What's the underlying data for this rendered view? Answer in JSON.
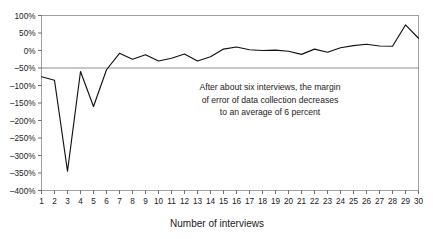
{
  "chart_data": {
    "type": "line",
    "title": "",
    "xlabel": "Number of interviews",
    "ylabel": "",
    "x": [
      1,
      2,
      3,
      4,
      5,
      6,
      7,
      8,
      9,
      10,
      11,
      12,
      13,
      14,
      15,
      16,
      17,
      18,
      19,
      20,
      21,
      22,
      23,
      24,
      25,
      26,
      27,
      28,
      29,
      30
    ],
    "values": [
      -75,
      -85,
      -345,
      -60,
      -160,
      -55,
      -8,
      -25,
      -12,
      -30,
      -22,
      -10,
      -30,
      -18,
      4,
      10,
      2,
      0,
      1,
      -2,
      -11,
      4,
      -5,
      8,
      14,
      18,
      13,
      12,
      73,
      35
    ],
    "categories": [
      "1",
      "2",
      "3",
      "4",
      "5",
      "6",
      "7",
      "8",
      "9",
      "10",
      "11",
      "12",
      "13",
      "14",
      "15",
      "16",
      "17",
      "18",
      "19",
      "20",
      "21",
      "22",
      "23",
      "24",
      "25",
      "26",
      "27",
      "28",
      "29",
      "30"
    ],
    "xlim": [
      1,
      30
    ],
    "ylim": [
      -400,
      100
    ],
    "ytick_values": [
      100,
      50,
      0,
      -50,
      -100,
      -150,
      -200,
      -250,
      -300,
      -350,
      -400
    ],
    "ytick_labels": [
      "100%",
      "50%",
      "0%",
      "–50%",
      "–100%",
      "–150%",
      "–200%",
      "–250%",
      "–300%",
      "–350%",
      "–400%"
    ],
    "grid": false,
    "zero_reference_line": true,
    "legend": "none",
    "series_color": "#111111",
    "frame_color": "#8a8a8a",
    "annotations": [
      {
        "name": "margin-of-error-note",
        "lines": [
          "After about six interviews, the margin",
          "of error of data collection decreases",
          "to an average of 6 percent"
        ]
      }
    ]
  }
}
